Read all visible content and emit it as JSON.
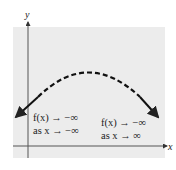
{
  "diagram": {
    "panel_color": "#ececec",
    "axes": {
      "x_label": "x",
      "y_label": "y"
    },
    "annotations": {
      "left_line1": "f(x) → −∞",
      "left_line2": "as x → −∞",
      "right_line1": "f(x) → −∞",
      "right_line2": "as x → ∞"
    },
    "curve": {
      "style": "dashed",
      "shape": "downward parabola",
      "ends": "arrows pointing down"
    }
  }
}
